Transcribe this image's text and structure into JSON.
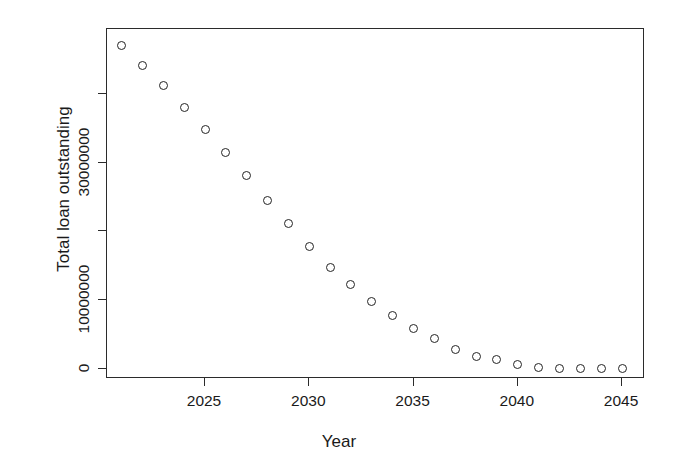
{
  "chart_data": {
    "type": "scatter",
    "title": "",
    "xlabel": "Year",
    "ylabel": "Total loan outstanding",
    "xlim": [
      2020.3,
      2046.1
    ],
    "ylim": [
      -1500000,
      49500000
    ],
    "grid": false,
    "legend": null,
    "point_style": {
      "marker": "open-circle",
      "color": "#242424",
      "fill": "none",
      "size": 9
    },
    "x": [
      2021,
      2022,
      2023,
      2024,
      2025,
      2026,
      2027,
      2028,
      2029,
      2030,
      2031,
      2032,
      2033,
      2034,
      2035,
      2036,
      2037,
      2038,
      2039,
      2040,
      2041,
      2042,
      2043,
      2044,
      2045
    ],
    "y": [
      47100000,
      44200000,
      41200000,
      38000000,
      34900000,
      31500000,
      28100000,
      24500000,
      21200000,
      17800000,
      14800000,
      12200000,
      9800000,
      7800000,
      5900000,
      4400000,
      2800000,
      1800000,
      1300000,
      600000,
      150000,
      0,
      0,
      0,
      0
    ],
    "xticks": [
      2025,
      2030,
      2035,
      2040,
      2045
    ],
    "xticklabels": [
      "2025",
      "2030",
      "2035",
      "2040",
      "2045"
    ],
    "yticks": [
      0,
      10000000,
      20000000,
      30000000,
      40000000
    ],
    "yticklabels": [
      "0",
      "10000000",
      "",
      "30000000",
      ""
    ]
  }
}
